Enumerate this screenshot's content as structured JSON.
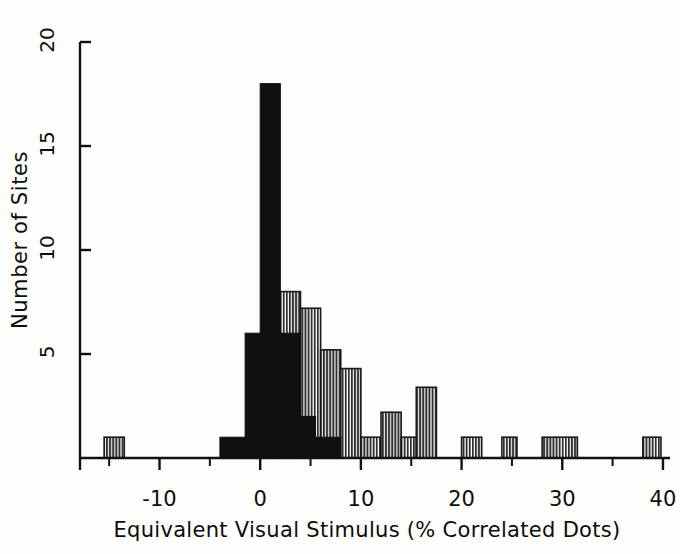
{
  "chart_data": {
    "type": "bar",
    "title": "",
    "subtitle": "",
    "xlabel": "Equivalent Visual Stimulus (% Correlated Dots)",
    "ylabel": "Number of Sites",
    "xlim": [
      -17.5,
      40.5
    ],
    "ylim": [
      0,
      20
    ],
    "xticks": [
      -10,
      0,
      10,
      20,
      30,
      40
    ],
    "xtick_labels": [
      "-10",
      "0",
      "10",
      "20",
      "30",
      "40"
    ],
    "xminor_ticks": [
      -15,
      -5,
      5,
      15,
      25,
      35
    ],
    "yticks": [
      5,
      10,
      15,
      20
    ],
    "ytick_labels": [
      "5",
      "10",
      "15",
      "20"
    ],
    "grid": false,
    "legend": "none",
    "bin_width": 2.5,
    "series": [
      {
        "name": "filled",
        "style": "solid-black",
        "color": "#101010",
        "bins": [
          {
            "x0": -4.0,
            "x1": -1.5,
            "value": 1
          },
          {
            "x0": -1.5,
            "x1": 0.0,
            "value": 6
          },
          {
            "x0": 0.0,
            "x1": 2.0,
            "value": 18
          },
          {
            "x0": 2.0,
            "x1": 4.0,
            "value": 6
          },
          {
            "x0": 4.0,
            "x1": 5.5,
            "value": 2
          },
          {
            "x0": 5.5,
            "x1": 8.0,
            "value": 1
          }
        ]
      },
      {
        "name": "hatched",
        "style": "vertical-hatch",
        "color": "#3a3a3a",
        "bins": [
          {
            "x0": -15.5,
            "x1": -13.5,
            "value": 1
          },
          {
            "x0": 2.0,
            "x1": 4.0,
            "value": 8
          },
          {
            "x0": 4.0,
            "x1": 6.0,
            "value": 7.2
          },
          {
            "x0": 6.0,
            "x1": 8.0,
            "value": 5.2
          },
          {
            "x0": 8.0,
            "x1": 10.0,
            "value": 4.3
          },
          {
            "x0": 10.0,
            "x1": 12.0,
            "value": 1
          },
          {
            "x0": 12.0,
            "x1": 14.0,
            "value": 2.2
          },
          {
            "x0": 14.0,
            "x1": 15.5,
            "value": 1
          },
          {
            "x0": 15.5,
            "x1": 17.5,
            "value": 3.4
          },
          {
            "x0": 20.0,
            "x1": 22.0,
            "value": 1
          },
          {
            "x0": 24.0,
            "x1": 25.5,
            "value": 1
          },
          {
            "x0": 28.0,
            "x1": 31.5,
            "value": 1
          },
          {
            "x0": 38.0,
            "x1": 39.8,
            "value": 1
          }
        ]
      }
    ]
  },
  "axes": {
    "ylabel": "Number of Sites",
    "xlabel": "Equivalent Visual Stimulus (% Correlated Dots)"
  }
}
